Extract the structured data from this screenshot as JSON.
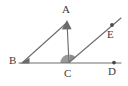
{
  "figure": {
    "kind": "geometry-diagram",
    "background_color": "#ffffff",
    "stroke_color": "#6e6e6e",
    "label_color": "#3b3b3b",
    "angle_fill_color": "#9a9a9a",
    "marker_color": "#6b6b6b",
    "width": 128,
    "height": 86
  },
  "points": [
    {
      "id": "A",
      "label": "A",
      "x": 67,
      "y": 22,
      "label_x": 62,
      "label_y": 5,
      "marker": "arrowhead-up"
    },
    {
      "id": "B",
      "label": "B",
      "x": 22,
      "y": 63,
      "label_x": 9,
      "label_y": 56,
      "marker": "arrowhead-right"
    },
    {
      "id": "C",
      "label": "C",
      "x": 69,
      "y": 63,
      "label_x": 64,
      "label_y": 67,
      "marker": "none"
    },
    {
      "id": "D",
      "label": "D",
      "x": 114,
      "y": 62,
      "label_x": 108,
      "label_y": 65,
      "marker": "dot"
    },
    {
      "id": "E",
      "label": "E",
      "x": 112,
      "y": 25,
      "label_x": 106,
      "label_y": 29,
      "marker": "dot"
    }
  ],
  "segments": [
    {
      "name": "line-BD",
      "from": "B",
      "to": "D",
      "x1": 19,
      "y1": 63,
      "x2": 121,
      "y2": 63
    },
    {
      "name": "segment-BA",
      "from": "B",
      "to": "A",
      "x1": 22,
      "y1": 63,
      "x2": 67,
      "y2": 22
    },
    {
      "name": "segment-AC",
      "from": "A",
      "to": "C",
      "x1": 67,
      "y1": 22,
      "x2": 69,
      "y2": 63
    },
    {
      "name": "ray-CE",
      "from": "C",
      "to": "E",
      "x1": 69,
      "y1": 63,
      "x2": 120,
      "y2": 19
    }
  ],
  "angle_marks": [
    {
      "name": "angle-ACB",
      "vertex": "C",
      "fill": "#9a9a9a",
      "path": "M 69 63 L 60.5 63 A 8.5 8.5 0 0 1 68.6 54.5 Z"
    },
    {
      "name": "angle-ACE",
      "vertex": "C",
      "fill": "#8f8f8f",
      "path": "M 69 63 L 69.4 54.5 A 8.5 8.5 0 0 1 75.5 57.2 Z"
    }
  ]
}
